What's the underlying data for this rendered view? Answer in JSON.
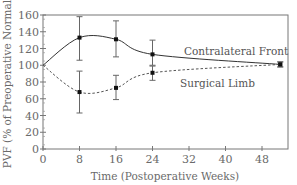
{
  "chart_data": {
    "type": "line",
    "title": "",
    "xlabel": "Time (Postoperative Weeks)",
    "ylabel": "PVF (% of Preoperative Normal)",
    "xlim": [
      0,
      54
    ],
    "ylim": [
      0,
      160
    ],
    "xticks": [
      0,
      8,
      16,
      24,
      32,
      40,
      48
    ],
    "yticks": [
      0,
      20,
      40,
      60,
      80,
      100,
      120,
      140,
      160
    ],
    "grid": false,
    "legend_position": "inline labels, right of week 24",
    "series": [
      {
        "name": "Contralateral Front",
        "line_style": "solid",
        "color": "#333333",
        "x": [
          0,
          8,
          16,
          24,
          52
        ],
        "values": [
          100,
          133,
          131,
          113,
          101
        ],
        "error_low": [
          null,
          106,
          110,
          100,
          98
        ],
        "error_high": [
          null,
          158,
          153,
          130,
          104
        ]
      },
      {
        "name": "Surgical Limb",
        "line_style": "dashed",
        "color": "#555555",
        "x": [
          0,
          8,
          16,
          24,
          52
        ],
        "values": [
          100,
          68,
          73,
          91,
          101
        ],
        "error_low": [
          null,
          43,
          59,
          82,
          98
        ],
        "error_high": [
          null,
          93,
          88,
          99,
          104
        ]
      }
    ]
  },
  "labels": {
    "xlabel": "Time (Postoperative Weeks)",
    "ylabel": "PVF (% of Preoperative Normal)",
    "legend_contralateral": "Contralateral Front",
    "legend_surgical": "Surgical Limb"
  }
}
